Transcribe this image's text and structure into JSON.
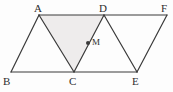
{
  "figure": {
    "width": 173,
    "height": 92,
    "background_color": "#fdfdfd",
    "stroke_color": "#3a3a3a",
    "shaded_fill_color": "#eeecec",
    "label_color": "#2e2e2e"
  },
  "vertices": [
    {
      "name": "A",
      "label": "A",
      "x": 39,
      "y": 15,
      "label_x": 34,
      "label_y": 3
    },
    {
      "name": "D",
      "label": "D",
      "x": 104,
      "y": 15,
      "label_x": 99,
      "label_y": 3
    },
    {
      "name": "F",
      "label": "F",
      "x": 167,
      "y": 15,
      "label_x": 161,
      "label_y": 3
    },
    {
      "name": "B",
      "label": "B",
      "x": 11,
      "y": 72,
      "label_x": 3,
      "label_y": 76
    },
    {
      "name": "C",
      "label": "C",
      "x": 74,
      "y": 72,
      "label_x": 69,
      "label_y": 76
    },
    {
      "name": "E",
      "label": "E",
      "x": 137,
      "y": 72,
      "label_x": 132,
      "label_y": 76
    }
  ],
  "interior_points": [
    {
      "name": "M",
      "label": "M",
      "x": 88,
      "y": 43,
      "label_x": 92,
      "label_y": 38,
      "dot_radius": 2
    }
  ],
  "segments": [
    {
      "name": "segment-A-F",
      "from": "A",
      "to": "F"
    },
    {
      "name": "segment-B-E",
      "from": "B",
      "to": "E"
    },
    {
      "name": "segment-A-B",
      "from": "A",
      "to": "B"
    },
    {
      "name": "segment-A-C",
      "from": "A",
      "to": "C"
    },
    {
      "name": "segment-D-C",
      "from": "D",
      "to": "C"
    },
    {
      "name": "segment-D-E",
      "from": "D",
      "to": "E"
    },
    {
      "name": "segment-F-E",
      "from": "F",
      "to": "E"
    }
  ],
  "shaded_regions": [
    {
      "name": "triangle-ADC",
      "vertices": [
        "A",
        "D",
        "C"
      ]
    }
  ]
}
